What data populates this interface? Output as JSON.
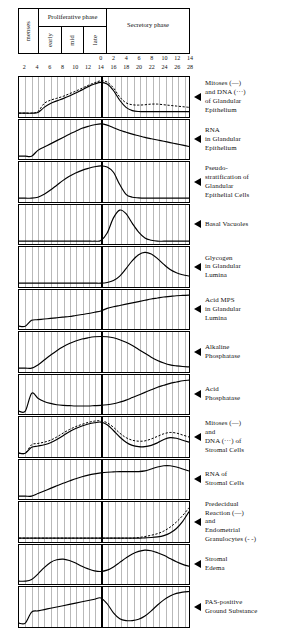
{
  "figure": {
    "phase_header": {
      "menses": "menses",
      "proliferative": "Proliferative\nphase",
      "proliferative_sub": [
        "early",
        "mid",
        "late"
      ],
      "secretory": "Secretory\nphase"
    },
    "axis": {
      "top_ticks": [
        "0",
        "2",
        "4",
        "6",
        "8",
        "10",
        "12",
        "14"
      ],
      "bottom_ticks": [
        "2",
        "4",
        "6",
        "8",
        "10",
        "12",
        "14",
        "16",
        "18",
        "20",
        "22",
        "24",
        "26",
        "28"
      ],
      "ovulation_day": 14,
      "day_min": 1,
      "day_max": 28
    }
  },
  "chart_data": {
    "type": "line",
    "xlabel": "Day of cycle",
    "ylabel": "Relative intensity",
    "xlim": [
      1,
      28
    ],
    "ylim": [
      0,
      1
    ],
    "grid": true,
    "legend": "inline-right-labels",
    "x": [
      1,
      2,
      3,
      4,
      5,
      6,
      7,
      8,
      9,
      10,
      11,
      12,
      13,
      14,
      15,
      16,
      17,
      18,
      19,
      20,
      21,
      22,
      23,
      24,
      25,
      26,
      27,
      28
    ],
    "panels": [
      {
        "label": "Mitoses (—)\nand DNA (···)\nof Glandular\nEpithelium",
        "series": [
          {
            "name": "Mitoses",
            "style": "solid",
            "values": [
              0,
              0,
              0,
              0.02,
              0.18,
              0.3,
              0.38,
              0.45,
              0.53,
              0.62,
              0.72,
              0.82,
              0.9,
              0.95,
              0.9,
              0.7,
              0.4,
              0.18,
              0.08,
              0.05,
              0.05,
              0.05,
              0.05,
              0.05,
              0.05,
              0.05,
              0.05,
              0.05
            ]
          },
          {
            "name": "DNA",
            "style": "dashed",
            "values": [
              0,
              0,
              0,
              0.05,
              0.3,
              0.4,
              0.46,
              0.52,
              0.6,
              0.68,
              0.77,
              0.86,
              0.94,
              1.0,
              0.96,
              0.78,
              0.5,
              0.32,
              0.26,
              0.25,
              0.26,
              0.28,
              0.28,
              0.26,
              0.24,
              0.22,
              0.2,
              0.18
            ]
          }
        ]
      },
      {
        "label": "RNA\nin Glandular\nEpithelium",
        "series": [
          {
            "name": "RNA",
            "style": "solid",
            "values": [
              0,
              0,
              0,
              0.18,
              0.28,
              0.38,
              0.48,
              0.58,
              0.68,
              0.77,
              0.86,
              0.92,
              0.97,
              1.0,
              0.96,
              0.88,
              0.8,
              0.74,
              0.68,
              0.63,
              0.58,
              0.54,
              0.5,
              0.46,
              0.42,
              0.38,
              0.34,
              0.3
            ]
          }
        ]
      },
      {
        "label": "Pseudo-\nstratification of\nGlandular\nEpithelial Cells",
        "series": [
          {
            "name": "Pseudostratification",
            "style": "solid",
            "values": [
              0,
              0,
              0,
              0.03,
              0.12,
              0.25,
              0.4,
              0.55,
              0.68,
              0.78,
              0.86,
              0.92,
              0.97,
              1.0,
              0.96,
              0.8,
              0.42,
              0.12,
              0.03,
              0.01,
              0,
              0,
              0,
              0,
              0,
              0,
              0,
              0
            ]
          }
        ]
      },
      {
        "label": "Basal Vacuoles",
        "series": [
          {
            "name": "Basal vacuoles",
            "style": "solid",
            "values": [
              0,
              0,
              0,
              0,
              0,
              0,
              0,
              0,
              0,
              0,
              0,
              0,
              0,
              0.02,
              0.25,
              0.72,
              0.96,
              0.85,
              0.55,
              0.28,
              0.1,
              0.03,
              0,
              0,
              0,
              0,
              0,
              0
            ]
          }
        ]
      },
      {
        "label": "Glycogen\nin Glandular\nLumina",
        "series": [
          {
            "name": "Glycogen",
            "style": "solid",
            "values": [
              0,
              0,
              0,
              0,
              0,
              0,
              0,
              0,
              0,
              0,
              0,
              0,
              0,
              0,
              0.02,
              0.08,
              0.22,
              0.45,
              0.7,
              0.88,
              0.95,
              0.9,
              0.76,
              0.58,
              0.42,
              0.32,
              0.26,
              0.22
            ]
          }
        ]
      },
      {
        "label": "Acid MPS\nin Glandular\nLumina",
        "series": [
          {
            "name": "Acid MPS",
            "style": "solid",
            "values": [
              0,
              0,
              0.18,
              0.2,
              0.22,
              0.24,
              0.26,
              0.28,
              0.3,
              0.33,
              0.36,
              0.39,
              0.43,
              0.47,
              0.55,
              0.6,
              0.64,
              0.68,
              0.72,
              0.76,
              0.8,
              0.84,
              0.87,
              0.9,
              0.92,
              0.94,
              0.95,
              0.96
            ]
          }
        ]
      },
      {
        "label": "Alkaline\nPhosphatase",
        "series": [
          {
            "name": "Alkaline phosphatase",
            "style": "solid",
            "values": [
              0,
              0,
              0,
              0.1,
              0.25,
              0.4,
              0.54,
              0.66,
              0.76,
              0.84,
              0.9,
              0.94,
              0.97,
              0.98,
              0.97,
              0.94,
              0.88,
              0.8,
              0.7,
              0.58,
              0.46,
              0.34,
              0.24,
              0.16,
              0.1,
              0.07,
              0.05,
              0.04
            ]
          }
        ]
      },
      {
        "label": "Acid\nPhosphatase",
        "series": [
          {
            "name": "Acid phosphatase",
            "style": "solid",
            "values": [
              0,
              0,
              0.55,
              0.4,
              0.3,
              0.24,
              0.2,
              0.18,
              0.17,
              0.16,
              0.16,
              0.16,
              0.17,
              0.18,
              0.2,
              0.23,
              0.28,
              0.34,
              0.42,
              0.5,
              0.58,
              0.66,
              0.74,
              0.8,
              0.86,
              0.9,
              0.94,
              0.96
            ]
          }
        ]
      },
      {
        "label": "Mitoses (—)\nand\nDNA (···) of\nStromal Cells",
        "series": [
          {
            "name": "Mitoses",
            "style": "solid",
            "values": [
              0,
              0,
              0.18,
              0.22,
              0.26,
              0.32,
              0.42,
              0.54,
              0.66,
              0.76,
              0.84,
              0.9,
              0.94,
              0.96,
              0.88,
              0.7,
              0.5,
              0.34,
              0.24,
              0.2,
              0.2,
              0.24,
              0.32,
              0.42,
              0.48,
              0.46,
              0.4,
              0.34
            ]
          },
          {
            "name": "DNA",
            "style": "dashed",
            "values": [
              0,
              0,
              0.26,
              0.3,
              0.34,
              0.4,
              0.5,
              0.62,
              0.73,
              0.82,
              0.89,
              0.95,
              0.99,
              1.0,
              0.94,
              0.8,
              0.62,
              0.48,
              0.4,
              0.37,
              0.38,
              0.44,
              0.52,
              0.6,
              0.64,
              0.62,
              0.56,
              0.5
            ]
          }
        ]
      },
      {
        "label": "RNA of\nStromal Cells",
        "series": [
          {
            "name": "RNA",
            "style": "solid",
            "values": [
              0,
              0,
              0,
              0.08,
              0.16,
              0.24,
              0.32,
              0.4,
              0.47,
              0.54,
              0.6,
              0.65,
              0.69,
              0.72,
              0.74,
              0.75,
              0.76,
              0.76,
              0.76,
              0.76,
              0.78,
              0.84,
              0.9,
              0.94,
              0.94,
              0.9,
              0.84,
              0.78
            ]
          }
        ]
      },
      {
        "label": "Predecidual\nReaction (—)\nand\nEndometrial\nGranulocytes (- -)",
        "series": [
          {
            "name": "Predecidual reaction",
            "style": "solid",
            "values": [
              0,
              0,
              0,
              0,
              0,
              0,
              0,
              0,
              0,
              0,
              0,
              0,
              0,
              0,
              0,
              0,
              0,
              0,
              0,
              0,
              0.01,
              0.02,
              0.04,
              0.08,
              0.16,
              0.3,
              0.52,
              0.82
            ]
          },
          {
            "name": "Endometrial granulocytes",
            "style": "dashed",
            "values": [
              0,
              0,
              0,
              0,
              0,
              0,
              0,
              0,
              0,
              0,
              0,
              0,
              0,
              0,
              0,
              0,
              0,
              0,
              0,
              0.02,
              0.05,
              0.09,
              0.14,
              0.22,
              0.34,
              0.5,
              0.7,
              0.94
            ]
          }
        ]
      },
      {
        "label": "Stromal\nEdema",
        "series": [
          {
            "name": "Stromal edema",
            "style": "solid",
            "values": [
              0,
              0,
              0.05,
              0.22,
              0.42,
              0.58,
              0.66,
              0.68,
              0.64,
              0.56,
              0.46,
              0.38,
              0.32,
              0.3,
              0.34,
              0.44,
              0.58,
              0.72,
              0.84,
              0.92,
              0.96,
              0.94,
              0.88,
              0.8,
              0.7,
              0.6,
              0.52,
              0.46
            ]
          }
        ]
      },
      {
        "label": "PAS-positive\nGround  Substance",
        "series": [
          {
            "name": "PAS-positive ground substance",
            "style": "solid",
            "values": [
              0,
              0,
              0.34,
              0.38,
              0.42,
              0.46,
              0.5,
              0.54,
              0.58,
              0.62,
              0.66,
              0.7,
              0.74,
              0.78,
              0.6,
              0.32,
              0.14,
              0.08,
              0.08,
              0.12,
              0.22,
              0.38,
              0.56,
              0.72,
              0.84,
              0.92,
              0.96,
              0.98
            ]
          }
        ]
      }
    ]
  }
}
